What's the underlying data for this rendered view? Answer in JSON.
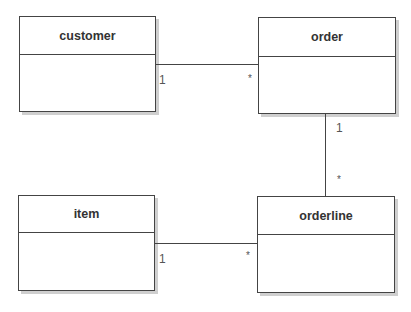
{
  "diagram": {
    "type": "uml-class-diagram",
    "classes": [
      {
        "id": "customer",
        "name": "customer"
      },
      {
        "id": "order",
        "name": "order"
      },
      {
        "id": "item",
        "name": "item"
      },
      {
        "id": "orderline",
        "name": "orderline"
      }
    ],
    "associations": [
      {
        "from": "customer",
        "to": "order",
        "from_mult": "1",
        "to_mult": "*"
      },
      {
        "from": "order",
        "to": "orderline",
        "from_mult": "1",
        "to_mult": "*"
      },
      {
        "from": "item",
        "to": "orderline",
        "from_mult": "1",
        "to_mult": "*"
      }
    ]
  },
  "colors": {
    "line": "#444444",
    "shadow": "#cfcfcf",
    "background": "#ffffff"
  }
}
